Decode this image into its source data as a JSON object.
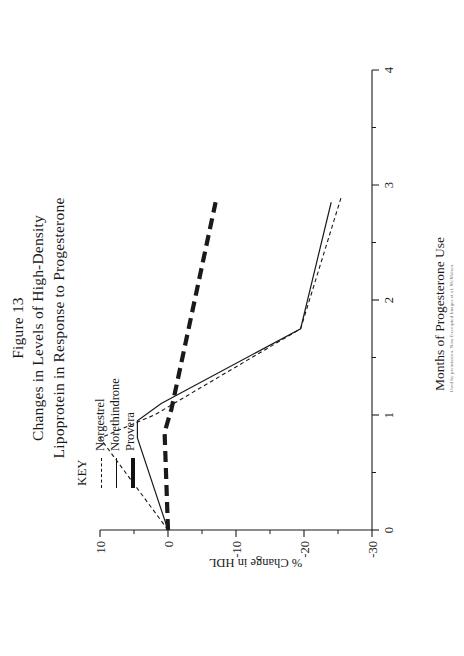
{
  "figure": {
    "title_lines": [
      "Figure 13",
      "Changes in Levels of High-Density",
      "Lipoprotein in Response to Progesterone"
    ],
    "credit": "Used by permission. Now Excerpted Images et al. McMahon."
  },
  "key": {
    "heading": "KEY",
    "entries": [
      {
        "label": "Norgestrel",
        "style": "dashed"
      },
      {
        "label": "Norethindrone",
        "style": "solid"
      },
      {
        "label": "Provera",
        "style": "thick-dashed"
      }
    ]
  },
  "chart_data": {
    "type": "line",
    "title": "Changes in Levels of High-Density Lipoprotein in Response to Progesterone",
    "xlabel": "Months of Progesterone Use",
    "ylabel": "% Change in HDL",
    "xlim": [
      0,
      4
    ],
    "ylim": [
      -30,
      10
    ],
    "xticks": [
      0,
      1,
      2,
      3,
      4
    ],
    "xticklabels": [
      "0",
      "1",
      "2",
      "3",
      "4"
    ],
    "yticks": [
      10,
      0,
      -10,
      -20,
      -30
    ],
    "yticklabels": [
      "10",
      "0",
      "-10",
      "-20",
      "-30"
    ],
    "minor_xticks": [
      0.5,
      1.5,
      2.5,
      3.5
    ],
    "minor_yticks": [
      5,
      -5,
      -15,
      -25
    ],
    "grid": false,
    "legend_position": "upper-left",
    "series": [
      {
        "name": "Norgestrel",
        "style": "dashed",
        "x": [
          0.0,
          0.8,
          1.0,
          1.75,
          2.9
        ],
        "y": [
          0.0,
          10.0,
          2.0,
          -19.5,
          -25.5
        ]
      },
      {
        "name": "Norethindrone",
        "style": "solid",
        "x": [
          0.0,
          0.8,
          0.95,
          1.1,
          1.75,
          2.85
        ],
        "y": [
          0.0,
          4.5,
          4.5,
          1.0,
          -19.5,
          -24.0
        ]
      },
      {
        "name": "Provera",
        "style": "thick-dashed",
        "x": [
          0.0,
          0.85,
          1.05,
          2.85
        ],
        "y": [
          0.0,
          0.5,
          -0.5,
          -7.0
        ]
      }
    ]
  }
}
